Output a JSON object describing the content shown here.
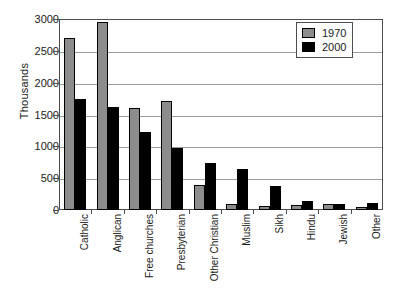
{
  "chart_data": {
    "type": "bar",
    "title": "",
    "xlabel": "",
    "ylabel": "Thousands",
    "ylim": [
      0,
      3000
    ],
    "ytick_step": 500,
    "yticks": [
      "0",
      "500",
      "1000",
      "1500",
      "2000",
      "2500",
      "3000"
    ],
    "grid": true,
    "legend_position": "top-right",
    "categories": [
      "Catholic",
      "Anglican",
      "Free churches",
      "Presbyterian",
      "Other Christian",
      "Muslim",
      "Sikh",
      "Hindu",
      "Jewish",
      "Other"
    ],
    "series": [
      {
        "name": "1970",
        "color": "#8c8c8c",
        "values": [
          2700,
          2950,
          1600,
          1720,
          400,
          90,
          70,
          80,
          90,
          50
        ]
      },
      {
        "name": "2000",
        "color": "#000000",
        "values": [
          1740,
          1620,
          1230,
          970,
          740,
          640,
          370,
          145,
          90,
          105
        ]
      }
    ]
  },
  "legend": {
    "items": [
      {
        "label": "1970"
      },
      {
        "label": "2000"
      }
    ]
  }
}
